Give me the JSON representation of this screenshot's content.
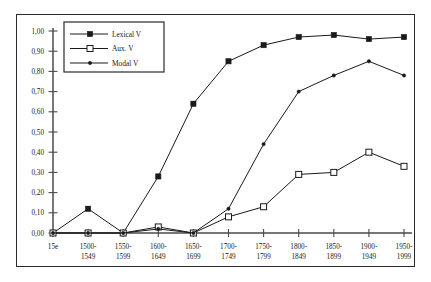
{
  "chart_data": {
    "type": "line",
    "title": "",
    "subtitle": "",
    "xlabel": "",
    "ylabel": "",
    "ylim": [
      0.0,
      1.0
    ],
    "grid": false,
    "legend_position": "upper-left",
    "decimal_separator": ",",
    "categories": [
      "15e",
      "1500-1549",
      "1550-1599",
      "1600-1649",
      "1650-1699",
      "1700-1749",
      "1750-1799",
      "1800-1849",
      "1850-1899",
      "1900-1949",
      "1950-1999"
    ],
    "category_lines": [
      [
        "15e",
        ""
      ],
      [
        "1500-",
        "1549"
      ],
      [
        "1550-",
        "1599"
      ],
      [
        "1600-",
        "1649"
      ],
      [
        "1650-",
        "1699"
      ],
      [
        "1700-",
        "1749"
      ],
      [
        "1750-",
        "1799"
      ],
      [
        "1800-",
        "1849"
      ],
      [
        "1850-",
        "1899"
      ],
      [
        "1900-",
        "1949"
      ],
      [
        "1950-",
        "1999"
      ]
    ],
    "ytick_labels": [
      "0,00",
      "0,10",
      "0,20",
      "0,30",
      "0,40",
      "0,50",
      "0,60",
      "0,70",
      "0,80",
      "0,90",
      "1,00"
    ],
    "ytick_values": [
      0.0,
      0.1,
      0.2,
      0.3,
      0.4,
      0.5,
      0.6,
      0.7,
      0.8,
      0.9,
      1.0
    ],
    "series": [
      {
        "name": "Lexical V",
        "marker": "filled-square",
        "color": "#1a1a1a",
        "values": [
          0.0,
          0.12,
          0.0,
          0.28,
          0.64,
          0.85,
          0.93,
          0.97,
          0.98,
          0.96,
          0.97
        ]
      },
      {
        "name": "Aux. V",
        "marker": "open-square",
        "color": "#1a1a1a",
        "values": [
          0.0,
          0.0,
          0.0,
          0.03,
          0.0,
          0.08,
          0.13,
          0.29,
          0.3,
          0.4,
          0.33
        ]
      },
      {
        "name": "Modal V",
        "marker": "dot",
        "color": "#1a1a1a",
        "values": [
          0.0,
          0.0,
          0.0,
          0.02,
          0.0,
          0.12,
          0.44,
          0.7,
          0.78,
          0.85,
          0.78
        ]
      }
    ]
  },
  "legend": {
    "entries": [
      {
        "label": "Lexical V",
        "marker": "filled-square"
      },
      {
        "label": "Aux. V",
        "marker": "open-square"
      },
      {
        "label": "Modal V",
        "marker": "dot"
      }
    ]
  }
}
